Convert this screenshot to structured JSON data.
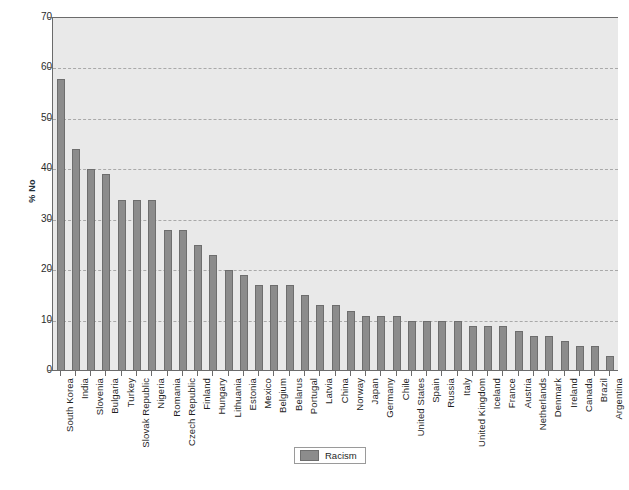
{
  "chart_data": {
    "type": "bar",
    "title": "",
    "xlabel": "",
    "ylabel": "% No",
    "ylim": [
      0,
      70
    ],
    "yticks": [
      0,
      10,
      20,
      30,
      40,
      50,
      60,
      70
    ],
    "grid": "horizontal-dashed",
    "legend_position": "bottom-center",
    "legend_entries": [
      "Racism"
    ],
    "series_name": "Racism",
    "bar_color": "#8c8c8c",
    "plot_background": "#e9e9e9",
    "categories": [
      "South Korea",
      "India",
      "Slovenia",
      "Bulgaria",
      "Turkey",
      "Slovak Republic",
      "Nigeria",
      "Romania",
      "Czech Republic",
      "Finland",
      "Hungary",
      "Lithuania",
      "Estonia",
      "Mexico",
      "Belgium",
      "Belarus",
      "Portugal",
      "Latvia",
      "China",
      "Norway",
      "Japan",
      "Germany",
      "Chile",
      "United States",
      "Spain",
      "Russia",
      "Italy",
      "United Kingdom",
      "Iceland",
      "France",
      "Austria",
      "Netherlands",
      "Denmark",
      "Ireland",
      "Canada",
      "Brazil",
      "Argentina"
    ],
    "values": [
      58,
      44,
      40,
      39,
      34,
      34,
      34,
      28,
      28,
      25,
      23,
      20,
      19,
      17,
      17,
      17,
      15,
      13,
      13,
      12,
      11,
      11,
      11,
      10,
      10,
      10,
      10,
      9,
      9,
      9,
      8,
      7,
      7,
      6,
      5,
      5,
      3
    ]
  }
}
